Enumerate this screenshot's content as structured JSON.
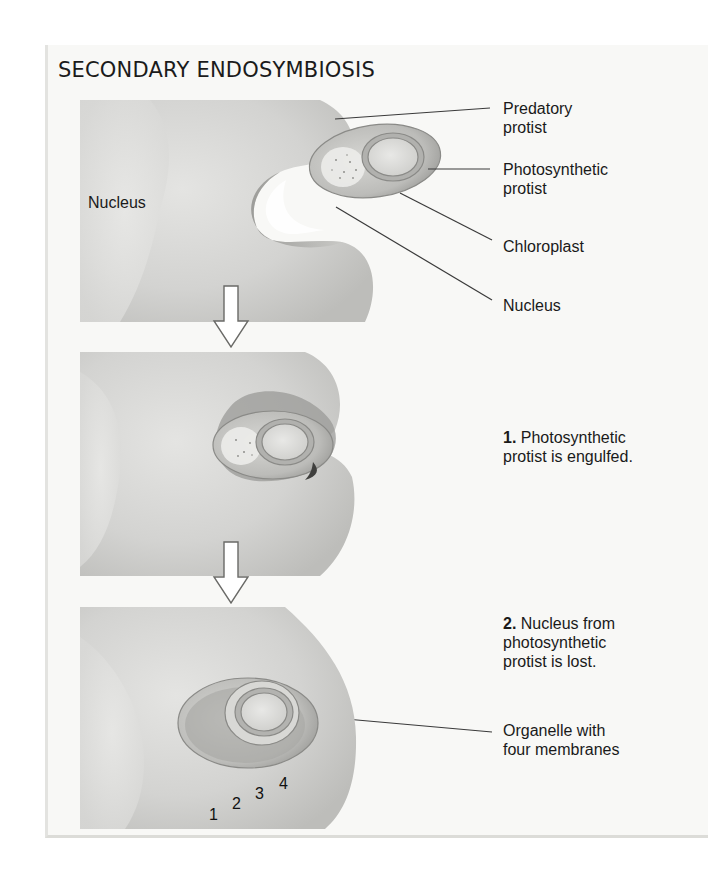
{
  "title": "SECONDARY ENDOSYMBIOSIS",
  "panels": [
    {
      "id": "stage-0",
      "inner_label": "Nucleus",
      "callouts": [
        {
          "text_line1": "Predatory",
          "text_line2": "protist"
        },
        {
          "text_line1": "Photosynthetic",
          "text_line2": "protist"
        },
        {
          "text_line1": "Chloroplast",
          "text_line2": ""
        },
        {
          "text_line1": "Nucleus",
          "text_line2": ""
        }
      ]
    },
    {
      "id": "stage-1",
      "step_number": "1.",
      "step_line1": "Photosynthetic",
      "step_line2": "protist is engulfed."
    },
    {
      "id": "stage-2",
      "step_number": "2.",
      "step_line1": "Nucleus from",
      "step_line2": "photosynthetic",
      "step_line3": "protist is lost.",
      "callout_line1": "Organelle with",
      "callout_line2": "four membranes",
      "membrane_numbers": [
        "1",
        "2",
        "3",
        "4"
      ]
    }
  ],
  "colors": {
    "cell_fill": "#d6d6d4",
    "cell_dark": "#a9a9a6",
    "organelle_fill": "#c4c4c1",
    "leader_line": "#3a3a3a",
    "background": "#f8f8f6"
  }
}
